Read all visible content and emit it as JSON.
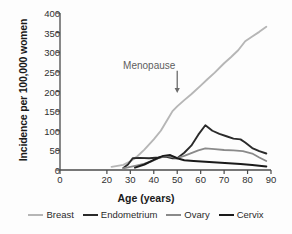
{
  "chart_data": {
    "type": "line",
    "title": "",
    "xlabel": "Age (years)",
    "ylabel": "Incidence per 100,000 women",
    "xlim": [
      0,
      90
    ],
    "ylim": [
      0,
      400
    ],
    "xticks": [
      0,
      20,
      30,
      40,
      50,
      60,
      70,
      80,
      90
    ],
    "xticklabels": [
      "0",
      "20",
      "30",
      "40",
      "50",
      "60",
      "70",
      "80",
      "90"
    ],
    "yticks": [
      0,
      50,
      100,
      150,
      200,
      250,
      300,
      350,
      400
    ],
    "yticklabels": [
      "0",
      "50",
      "100",
      "150",
      "200",
      "250",
      "300",
      "350",
      "400"
    ],
    "grid": false,
    "legend_position": "below",
    "annotations": [
      {
        "text": "Menopause",
        "x": 50,
        "y": 258,
        "arrow_to_x": 50,
        "arrow_to_y": 196,
        "color": "#6b6b6b"
      }
    ],
    "series": [
      {
        "name": "Breast",
        "color": "#b6b6b6",
        "width": 1.9,
        "x": [
          22,
          27,
          30,
          33,
          36,
          40,
          43,
          46,
          48,
          50,
          53,
          56,
          60,
          63,
          66,
          70,
          73,
          76,
          79,
          82,
          85,
          88
        ],
        "values": [
          8,
          13,
          22,
          35,
          52,
          78,
          100,
          130,
          150,
          162,
          178,
          193,
          215,
          232,
          248,
          272,
          288,
          305,
          328,
          340,
          352,
          365
        ]
      },
      {
        "name": "Endometrium",
        "color": "#2a2a2a",
        "width": 1.9,
        "x": [
          27,
          29,
          31,
          34,
          38,
          42,
          45,
          48,
          50,
          53,
          56,
          59,
          62,
          65,
          68,
          71,
          74,
          77,
          79,
          82,
          85,
          88
        ],
        "values": [
          5,
          14,
          30,
          31,
          30,
          32,
          34,
          30,
          30,
          44,
          62,
          90,
          114,
          100,
          92,
          86,
          80,
          78,
          70,
          56,
          48,
          42
        ]
      },
      {
        "name": "Ovary",
        "color": "#8a8a8a",
        "width": 1.8,
        "x": [
          27,
          30,
          33,
          36,
          39,
          42,
          45,
          47,
          50,
          53,
          56,
          59,
          62,
          66,
          70,
          74,
          78,
          82,
          85,
          88
        ],
        "values": [
          4,
          8,
          12,
          16,
          22,
          30,
          36,
          34,
          30,
          36,
          43,
          50,
          55,
          53,
          51,
          50,
          48,
          42,
          32,
          23
        ]
      },
      {
        "name": "Cervix",
        "color": "#1a1a1a",
        "width": 2.0,
        "x": [
          32,
          36,
          40,
          44,
          47,
          50,
          53,
          57,
          62,
          67,
          72,
          77,
          82,
          85,
          88
        ],
        "values": [
          6,
          14,
          26,
          36,
          38,
          30,
          25,
          23,
          21,
          19,
          17,
          15,
          13,
          11,
          9
        ]
      }
    ]
  },
  "legend": {
    "items": [
      {
        "label": "Breast",
        "color": "#b6b6b6"
      },
      {
        "label": "Endometrium",
        "color": "#2a2a2a"
      },
      {
        "label": "Ovary",
        "color": "#8a8a8a"
      },
      {
        "label": "Cervix",
        "color": "#1a1a1a"
      }
    ]
  }
}
